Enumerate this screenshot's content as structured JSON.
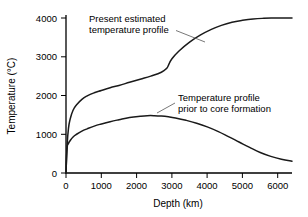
{
  "chart_data": {
    "type": "line",
    "title": "",
    "xlabel": "Depth (km)",
    "ylabel": "Temperature (°C)",
    "xlim": [
      0,
      6400
    ],
    "ylim": [
      0,
      4000
    ],
    "grid": false,
    "legend_position": "inline-annotations",
    "xticks": [
      0,
      1000,
      2000,
      3000,
      4000,
      5000,
      6000
    ],
    "xtick_labels": [
      "0",
      "1000",
      "2000",
      "3000",
      "4000",
      "5000",
      "6000"
    ],
    "yticks": [
      0,
      1000,
      2000,
      3000,
      4000
    ],
    "ytick_labels": [
      "0",
      "1000",
      "2000",
      "3000",
      "4000"
    ],
    "series": [
      {
        "name": "Present estimated temperature profile",
        "x": [
          0,
          30,
          70,
          120,
          200,
          300,
          450,
          600,
          800,
          1000,
          1250,
          1500,
          1800,
          2100,
          2400,
          2700,
          2850,
          2900,
          3000,
          3200,
          3500,
          3800,
          4100,
          4400,
          4700,
          5000,
          5300,
          5600,
          5900,
          6200,
          6400
        ],
        "y": [
          0,
          700,
          1150,
          1400,
          1620,
          1760,
          1900,
          1990,
          2070,
          2130,
          2200,
          2260,
          2340,
          2420,
          2500,
          2600,
          2700,
          2780,
          2950,
          3150,
          3380,
          3560,
          3700,
          3810,
          3890,
          3940,
          3975,
          3992,
          3998,
          4000,
          4000
        ]
      },
      {
        "name": "Temperature profile prior to core formation",
        "x": [
          0,
          30,
          70,
          120,
          200,
          300,
          450,
          600,
          800,
          1000,
          1250,
          1500,
          1800,
          2100,
          2300,
          2500,
          2700,
          2900,
          3100,
          3400,
          3700,
          4000,
          4300,
          4600,
          4900,
          5200,
          5500,
          5800,
          6100,
          6400
        ],
        "y": [
          0,
          620,
          760,
          840,
          930,
          1000,
          1080,
          1140,
          1210,
          1265,
          1325,
          1375,
          1430,
          1465,
          1480,
          1480,
          1470,
          1450,
          1420,
          1360,
          1285,
          1190,
          1075,
          940,
          800,
          660,
          530,
          430,
          355,
          305
        ]
      }
    ],
    "annotations": [
      {
        "id": "upper-curve-label",
        "lines": [
          "Present estimated",
          "temperature profile"
        ],
        "points_to_series": "Present estimated temperature profile"
      },
      {
        "id": "lower-curve-label",
        "lines": [
          "Temperature profile",
          "prior to core formation"
        ],
        "points_to_series": "Temperature profile prior to core formation"
      }
    ],
    "colors": {
      "curve": "#1a1a1a",
      "axis": "#000000",
      "background": "#ffffff",
      "leader": "#555555"
    }
  }
}
